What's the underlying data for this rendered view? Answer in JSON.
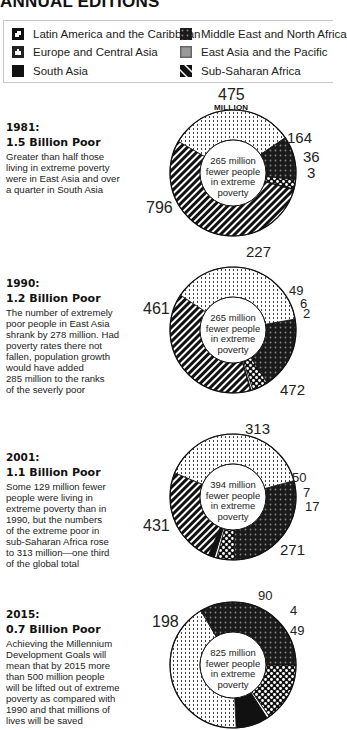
{
  "header": {
    "title": "ANNUAL EDITIONS"
  },
  "legend": [
    {
      "label": "Latin America and the Caribbean",
      "pattern": "checker"
    },
    {
      "label": "Middle East and North Africa",
      "pattern": "dark-cross"
    },
    {
      "label": "Europe and Central Asia",
      "pattern": "dark-dots"
    },
    {
      "label": "East Asia and the Pacific",
      "pattern": "gray"
    },
    {
      "label": "South Asia",
      "pattern": "solid"
    },
    {
      "label": "Sub-Saharan Africa",
      "pattern": "stripes"
    }
  ],
  "sections": [
    {
      "year": "1981:",
      "headline": "1.5 Billion Poor",
      "text": [
        "Greater than half those",
        "living in extreme poverty",
        "were in East Asia and over",
        "a quarter in South Asia"
      ]
    },
    {
      "year": "1990:",
      "headline": "1.2 Billion Poor",
      "text": [
        "The number of extremely",
        "poor people in East Asia",
        "shrank by 278 million. Had",
        "poverty rates there not",
        "fallen, population growth",
        "would have added",
        "285 million to the ranks",
        "of the severly poor"
      ]
    },
    {
      "year": "2001:",
      "headline": "1.1 Billion Poor",
      "text": [
        "Some 129 million fewer",
        "people were living in",
        "extreme poverty than in",
        "1990, but the numbers",
        "of the extreme poor in",
        "sub-Saharan Africa rose",
        "to 313 million—one third",
        "of the global total"
      ]
    },
    {
      "year": "2015:",
      "headline": "0.7 Billion Poor",
      "text": [
        "Achieving the Millennium",
        "Development Goals will",
        "mean that by 2015 more",
        "than 500 million people",
        "will be lifted out of extreme",
        "poverty as compared with",
        "1990 and that millions of",
        "lives will be saved"
      ]
    }
  ],
  "chart_data": [
    {
      "type": "pie",
      "title": "1981: 1.5 Billion Poor",
      "center_text": [
        "265 million",
        "fewer people",
        "in extreme",
        "poverty"
      ],
      "unit_label": "MILLION",
      "slices": [
        {
          "label": "475",
          "value": 475,
          "pattern": "dots"
        },
        {
          "label": "164",
          "value": 164,
          "pattern": "dark-cross"
        },
        {
          "label": "36",
          "value": 36,
          "pattern": "checker"
        },
        {
          "label": "3",
          "value": 3,
          "pattern": "solid"
        },
        {
          "label": "796",
          "value": 796,
          "pattern": "stripes"
        }
      ]
    },
    {
      "type": "pie",
      "title": "1990: 1.2 Billion Poor",
      "center_text": [
        "265 million",
        "fewer people",
        "in extreme",
        "poverty"
      ],
      "slices": [
        {
          "label": "227",
          "value": 227,
          "pattern": "dark-cross"
        },
        {
          "label": "49",
          "value": 49,
          "pattern": "checker"
        },
        {
          "label": "6",
          "value": 6,
          "pattern": "white"
        },
        {
          "label": "2",
          "value": 2,
          "pattern": "solid"
        },
        {
          "label": "472",
          "value": 472,
          "pattern": "stripes"
        },
        {
          "label": "461",
          "value": 461,
          "pattern": "dots"
        }
      ]
    },
    {
      "type": "pie",
      "title": "2001: 1.1 Billion Poor",
      "center_text": [
        "394 million",
        "fewer people",
        "in extreme",
        "poverty"
      ],
      "slices": [
        {
          "label": "313",
          "value": 313,
          "pattern": "dark-cross"
        },
        {
          "label": "50",
          "value": 50,
          "pattern": "checker"
        },
        {
          "label": "7",
          "value": 7,
          "pattern": "white"
        },
        {
          "label": "17",
          "value": 17,
          "pattern": "solid"
        },
        {
          "label": "271",
          "value": 271,
          "pattern": "stripes"
        },
        {
          "label": "431",
          "value": 431,
          "pattern": "dots"
        }
      ]
    },
    {
      "type": "pie",
      "title": "2015: 0.7 Billion Poor",
      "center_text": [
        "825 million",
        "fewer people",
        "in extreme",
        "poverty"
      ],
      "slices": [
        {
          "label": "90",
          "value": 90,
          "pattern": "checker"
        },
        {
          "label": "4",
          "value": 4,
          "pattern": "white"
        },
        {
          "label": "49",
          "value": 49,
          "pattern": "solid"
        },
        {
          "label": "",
          "value": 250,
          "pattern": "dots"
        },
        {
          "label": "198",
          "value": 198,
          "pattern": "dark-cross"
        }
      ]
    }
  ]
}
